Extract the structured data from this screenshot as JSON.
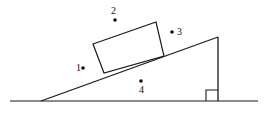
{
  "diagram": {
    "background_color": "#ffffff",
    "stroke_color": "#1a1a1a",
    "canvas": {
      "width": 270,
      "height": 117
    },
    "ground": {
      "name": "ground-line",
      "x1": 10,
      "y1": 101,
      "x2": 258,
      "y2": 101
    },
    "incline": {
      "name": "incline-surface-line",
      "x1": 41,
      "y1": 101,
      "x2": 218,
      "y2": 37
    },
    "vertical": {
      "name": "incline-vertical-side",
      "x1": 218,
      "y1": 37,
      "x2": 218,
      "y2": 101
    },
    "right_angle_marker": {
      "name": "right-angle-marker",
      "points": "206,101 206,90 218,90"
    },
    "block": {
      "name": "block-on-incline",
      "fill": "#ffffff",
      "corners": "93,44 156,22 164,56 104,73"
    },
    "points": [
      {
        "id": "1",
        "label": "1",
        "label_x": 76,
        "label_y": 71,
        "dot_x": 83,
        "dot_y": 68,
        "dot_r": 1.8
      },
      {
        "id": "2",
        "label": "2",
        "label_x": 111,
        "label_y": 14,
        "dot_x": 115,
        "dot_y": 20,
        "dot_r": 1.8
      },
      {
        "id": "3",
        "label": "3",
        "label_x": 177,
        "label_y": 35,
        "dot_x": 172,
        "dot_y": 32,
        "dot_r": 1.8
      },
      {
        "id": "4",
        "label": "4",
        "label_x": 139,
        "label_y": 93,
        "dot_x": 141,
        "dot_y": 81,
        "dot_r": 1.8
      }
    ]
  }
}
